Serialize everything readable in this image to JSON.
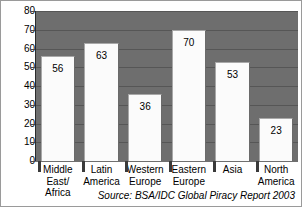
{
  "chart_data": {
    "type": "bar",
    "title": "",
    "xlabel": "",
    "ylabel": "",
    "categories": [
      "Middle East/ Africa",
      "Latin America",
      "Western Europe",
      "Eastern Europe",
      "Asia",
      "North America"
    ],
    "category_lines": [
      [
        "Middle",
        "East/",
        "Africa"
      ],
      [
        "Latin",
        "America"
      ],
      [
        "Western",
        "Europe"
      ],
      [
        "Eastern",
        "Europe"
      ],
      [
        "Asia"
      ],
      [
        "North",
        "America"
      ]
    ],
    "values": [
      56,
      63,
      36,
      70,
      53,
      23
    ],
    "ylim": [
      0,
      80
    ],
    "ytick_step": 10,
    "yticks": [
      "80",
      "70",
      "60",
      "50",
      "40",
      "30",
      "20",
      "10",
      "0"
    ],
    "grid": true,
    "legend": "none",
    "annotation": "Source: BSA/IDC Global Piracy Report 2003",
    "colors": {
      "plot_background": "#6e6e6e",
      "bar_fill": "#fbfbfb",
      "gridline": "#565656",
      "axis": "#2b2b2b",
      "text": "#000000",
      "border": "#9a9a9a"
    }
  }
}
